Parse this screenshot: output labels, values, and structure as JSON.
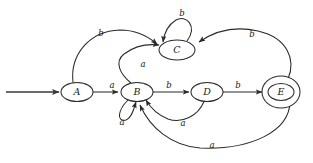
{
  "diagram": {
    "background_color": "#ffffff",
    "stroke_color": "#2b2b2b",
    "text_color": "#1a1a1a",
    "alphabet": [
      "a",
      "b"
    ],
    "start_state": "A",
    "accepting_states": [
      "E"
    ]
  },
  "nodes": [
    {
      "id": "A",
      "label": "A",
      "cx": 77,
      "cy": 92,
      "rx": 16,
      "ry": 9.5,
      "accepting": false
    },
    {
      "id": "B",
      "label": "B",
      "cx": 137,
      "cy": 92,
      "rx": 16,
      "ry": 9.5,
      "accepting": false
    },
    {
      "id": "C",
      "label": "C",
      "cx": 177,
      "cy": 50,
      "rx": 18,
      "ry": 10,
      "accepting": false
    },
    {
      "id": "D",
      "label": "D",
      "cx": 207,
      "cy": 92,
      "rx": 16,
      "ry": 9.5,
      "accepting": false
    },
    {
      "id": "E",
      "label": "E",
      "cx": 281,
      "cy": 92,
      "rx": 13,
      "ry": 8.5,
      "accepting": true
    }
  ],
  "edges": [
    {
      "id": "start",
      "from": "",
      "to": "A",
      "label": "",
      "label_x": 0,
      "label_y": 0
    },
    {
      "id": "A-C",
      "from": "A",
      "to": "C",
      "label": "b",
      "label_x": 101,
      "label_y": 33
    },
    {
      "id": "A-B",
      "from": "A",
      "to": "B",
      "label": "a",
      "label_x": 112,
      "label_y": 85
    },
    {
      "id": "B-C",
      "from": "B",
      "to": "C",
      "label": "a",
      "label_x": 143,
      "label_y": 64
    },
    {
      "id": "B-B",
      "from": "B",
      "to": "B",
      "label": "a",
      "label_x": 122,
      "label_y": 122
    },
    {
      "id": "B-D",
      "from": "B",
      "to": "D",
      "label": "b",
      "label_x": 169,
      "label_y": 85
    },
    {
      "id": "C-C",
      "from": "C",
      "to": "C",
      "label": "b",
      "label_x": 182,
      "label_y": 13
    },
    {
      "id": "D-B",
      "from": "D",
      "to": "B",
      "label": "a",
      "label_x": 183,
      "label_y": 123
    },
    {
      "id": "D-E",
      "from": "D",
      "to": "E",
      "label": "b",
      "label_x": 238,
      "label_y": 85
    },
    {
      "id": "E-C",
      "from": "E",
      "to": "C",
      "label": "b",
      "label_x": 252,
      "label_y": 34
    },
    {
      "id": "E-B",
      "from": "E",
      "to": "B",
      "label": "a",
      "label_x": 212,
      "label_y": 145
    }
  ]
}
